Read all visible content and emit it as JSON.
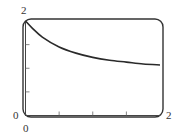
{
  "chart_data": {
    "type": "line",
    "title": "",
    "xlabel": "",
    "ylabel": "",
    "xlim": [
      0,
      2
    ],
    "ylim": [
      0,
      2
    ],
    "x_tick_labels": {
      "min": "0",
      "max": "2"
    },
    "y_tick_labels": {
      "min": "0",
      "max": "2"
    },
    "x_ticks": [
      0.5,
      1.0,
      1.5
    ],
    "y_ticks": [
      0.5,
      1.0,
      1.5
    ],
    "grid": false,
    "legend": null,
    "series": [
      {
        "name": "curve",
        "x": [
          0,
          0.1,
          0.25,
          0.5,
          0.75,
          1.0,
          1.25,
          1.5,
          1.75,
          2.0
        ],
        "y": [
          2.0,
          1.85,
          1.66,
          1.45,
          1.32,
          1.23,
          1.17,
          1.13,
          1.09,
          1.07
        ]
      }
    ],
    "colors": {
      "curve": "#2a2a2a",
      "frame": "#333333"
    }
  }
}
